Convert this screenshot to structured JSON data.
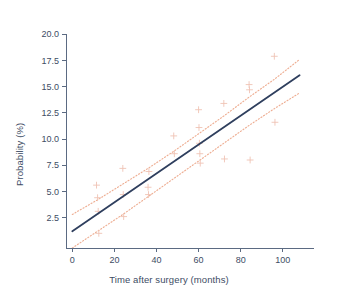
{
  "chart_data": {
    "type": "scatter",
    "title": "",
    "subtitle": "",
    "xlabel": "Time after surgery (months)",
    "ylabel": "Probability (%)",
    "xlim": [
      -3,
      112
    ],
    "ylim": [
      -0.4,
      20.6
    ],
    "xticks": [
      0,
      20,
      40,
      60,
      80,
      100
    ],
    "xtick_labels": [
      "0",
      "20",
      "40",
      "60",
      "80",
      "100"
    ],
    "yticks": [
      2.5,
      5.0,
      7.5,
      10.0,
      12.5,
      15.0,
      17.5,
      20.0
    ],
    "ytick_labels": [
      "2.5",
      "5.0",
      "7.5",
      "10.0",
      "12.5",
      "15.0",
      "17.5",
      "20.0"
    ],
    "grid": false,
    "legend": "none",
    "colors": {
      "fit_line": "#2f3f5e",
      "confidence_band": "#eeae93",
      "marker": "#efc3b4",
      "axis": "#5b6a82",
      "text": "#3d4c64",
      "background": "#ffffff"
    },
    "series": [
      {
        "name": "Fitted regression line",
        "type": "line",
        "style": "solid",
        "color": "#2f3f5e",
        "x": [
          0,
          108
        ],
        "values": [
          1.2,
          16.1
        ]
      },
      {
        "name": "Upper 95% confidence limit",
        "type": "line",
        "style": "dotted",
        "color": "#eeae93",
        "x": [
          0,
          12,
          24,
          36,
          48,
          60,
          72,
          84,
          96,
          108
        ],
        "values": [
          2.8,
          4.2,
          5.7,
          7.2,
          8.8,
          10.5,
          12.2,
          14.0,
          15.7,
          17.6
        ]
      },
      {
        "name": "Lower 95% confidence limit",
        "type": "line",
        "style": "dotted",
        "color": "#eeae93",
        "x": [
          0,
          12,
          24,
          36,
          48,
          60,
          72,
          84,
          96,
          108
        ],
        "values": [
          -0.4,
          1.2,
          2.8,
          4.5,
          6.2,
          7.9,
          9.6,
          11.3,
          12.9,
          14.4
        ]
      },
      {
        "name": "Observed probabilities",
        "type": "scatter",
        "marker": "plus",
        "color": "#efc3b4",
        "points": [
          {
            "x": 11.5,
            "y": 5.6
          },
          {
            "x": 12.0,
            "y": 4.4
          },
          {
            "x": 12.3,
            "y": 3.1
          },
          {
            "x": 12.6,
            "y": 1.0
          },
          {
            "x": 24.0,
            "y": 7.2
          },
          {
            "x": 24.2,
            "y": 4.7
          },
          {
            "x": 24.4,
            "y": 2.6
          },
          {
            "x": 36.0,
            "y": 5.4
          },
          {
            "x": 36.2,
            "y": 4.7
          },
          {
            "x": 36.4,
            "y": 6.9
          },
          {
            "x": 48.2,
            "y": 10.3
          },
          {
            "x": 48.5,
            "y": 8.6
          },
          {
            "x": 60.0,
            "y": 12.8
          },
          {
            "x": 60.2,
            "y": 11.1
          },
          {
            "x": 60.4,
            "y": 9.6
          },
          {
            "x": 60.6,
            "y": 8.6
          },
          {
            "x": 60.8,
            "y": 7.7
          },
          {
            "x": 72.0,
            "y": 13.4
          },
          {
            "x": 72.3,
            "y": 8.1
          },
          {
            "x": 84.0,
            "y": 15.2
          },
          {
            "x": 84.2,
            "y": 14.7
          },
          {
            "x": 84.5,
            "y": 8.0
          },
          {
            "x": 96.0,
            "y": 17.9
          },
          {
            "x": 96.3,
            "y": 11.6
          }
        ]
      }
    ]
  },
  "caption": {
    "text": ""
  }
}
